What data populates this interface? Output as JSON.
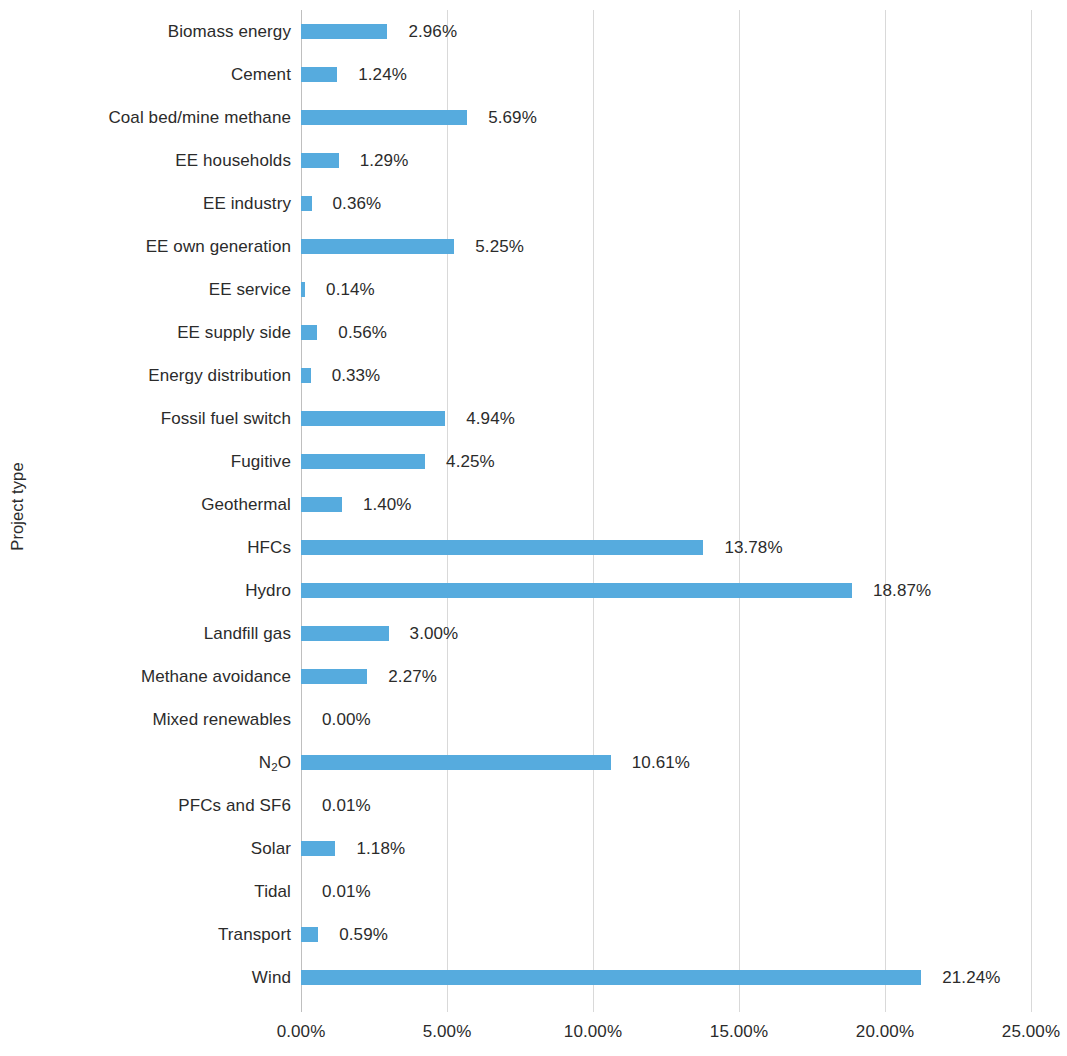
{
  "chart_data": {
    "type": "bar",
    "orientation": "horizontal",
    "title": "",
    "xlabel": "",
    "ylabel": "Project type",
    "xlim": [
      0,
      25
    ],
    "grid": true,
    "legend": null,
    "value_suffix": "%",
    "bar_color": "#56ABDE",
    "gridline_color": "#d9d9d9",
    "text_color": "#2b2b2b",
    "xticks": [
      "0.00%",
      "5.00%",
      "10.00%",
      "15.00%",
      "20.00%",
      "25.00%"
    ],
    "xtick_values": [
      0,
      5,
      10,
      15,
      20,
      25
    ],
    "categories": [
      "Biomass energy",
      "Cement",
      "Coal bed/mine methane",
      "EE households",
      "EE industry",
      "EE own generation",
      "EE service",
      "EE supply side",
      "Energy distribution",
      "Fossil fuel switch",
      "Fugitive",
      "Geothermal",
      "HFCs",
      "Hydro",
      "Landfill gas",
      "Methane avoidance",
      "Mixed renewables",
      "N2O",
      "PFCs and SF6",
      "Solar",
      "Tidal",
      "Transport",
      "Wind"
    ],
    "values": [
      2.96,
      1.24,
      5.69,
      1.29,
      0.36,
      5.25,
      0.14,
      0.56,
      0.33,
      4.94,
      4.25,
      1.4,
      13.78,
      18.87,
      3.0,
      2.27,
      0.0,
      10.61,
      0.01,
      1.18,
      0.01,
      0.59,
      21.24
    ],
    "data_labels": [
      "2.96%",
      "1.24%",
      "5.69%",
      "1.29%",
      "0.36%",
      "5.25%",
      "0.14%",
      "0.56%",
      "0.33%",
      "4.94%",
      "4.25%",
      "1.40%",
      "13.78%",
      "18.87%",
      "3.00%",
      "2.27%",
      "0.00%",
      "10.61%",
      "0.01%",
      "1.18%",
      "0.01%",
      "0.59%",
      "21.24%"
    ]
  },
  "rows": [
    {
      "label": "Biomass energy",
      "label_html": "Biomass energy",
      "value": 2.96,
      "value_label": "2.96%"
    },
    {
      "label": "Cement",
      "label_html": "Cement",
      "value": 1.24,
      "value_label": "1.24%"
    },
    {
      "label": "Coal bed/mine methane",
      "label_html": "Coal bed/mine methane",
      "value": 5.69,
      "value_label": "5.69%"
    },
    {
      "label": "EE households",
      "label_html": "EE households",
      "value": 1.29,
      "value_label": "1.29%"
    },
    {
      "label": "EE industry",
      "label_html": "EE industry",
      "value": 0.36,
      "value_label": "0.36%"
    },
    {
      "label": "EE own generation",
      "label_html": "EE own generation",
      "value": 5.25,
      "value_label": "5.25%"
    },
    {
      "label": "EE service",
      "label_html": "EE service",
      "value": 0.14,
      "value_label": "0.14%"
    },
    {
      "label": "EE supply side",
      "label_html": "EE supply side",
      "value": 0.56,
      "value_label": "0.56%"
    },
    {
      "label": "Energy distribution",
      "label_html": "Energy distribution",
      "value": 0.33,
      "value_label": "0.33%"
    },
    {
      "label": "Fossil fuel switch",
      "label_html": "Fossil fuel switch",
      "value": 4.94,
      "value_label": "4.94%"
    },
    {
      "label": "Fugitive",
      "label_html": "Fugitive",
      "value": 4.25,
      "value_label": "4.25%"
    },
    {
      "label": "Geothermal",
      "label_html": "Geothermal",
      "value": 1.4,
      "value_label": "1.40%"
    },
    {
      "label": "HFCs",
      "label_html": "HFCs",
      "value": 13.78,
      "value_label": "13.78%"
    },
    {
      "label": "Hydro",
      "label_html": "Hydro",
      "value": 18.87,
      "value_label": "18.87%"
    },
    {
      "label": "Landfill gas",
      "label_html": "Landfill gas",
      "value": 3.0,
      "value_label": "3.00%"
    },
    {
      "label": "Methane avoidance",
      "label_html": "Methane avoidance",
      "value": 2.27,
      "value_label": "2.27%"
    },
    {
      "label": "Mixed renewables",
      "label_html": "Mixed renewables",
      "value": 0.0,
      "value_label": "0.00%"
    },
    {
      "label": "N2O",
      "label_html": "N<sub>2</sub>O",
      "value": 10.61,
      "value_label": "10.61%"
    },
    {
      "label": "PFCs and SF6",
      "label_html": "PFCs and SF6",
      "value": 0.01,
      "value_label": "0.01%"
    },
    {
      "label": "Solar",
      "label_html": "Solar",
      "value": 1.18,
      "value_label": "1.18%"
    },
    {
      "label": "Tidal",
      "label_html": "Tidal",
      "value": 0.01,
      "value_label": "0.01%"
    },
    {
      "label": "Transport",
      "label_html": "Transport",
      "value": 0.59,
      "value_label": "0.59%"
    },
    {
      "label": "Wind",
      "label_html": "Wind",
      "value": 21.24,
      "value_label": "21.24%"
    }
  ],
  "axis": {
    "y_title": "Project type",
    "x_ticks": [
      "0.00%",
      "5.00%",
      "10.00%",
      "15.00%",
      "20.00%",
      "25.00%"
    ]
  }
}
